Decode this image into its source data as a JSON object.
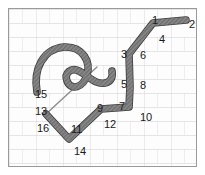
{
  "figure": {
    "background": "#fdfdfd",
    "border_color": "#9a9a9a",
    "stroke_color": "#7d7d7d",
    "stroke_outline_color": "#3c3c3c",
    "thin_line_color": "#8c8c8c",
    "label_color": "#1a1a1a"
  },
  "labels": [
    {
      "text": "1",
      "x": 143,
      "y": 6
    },
    {
      "text": "2",
      "x": 180,
      "y": 10
    },
    {
      "text": "3",
      "x": 112,
      "y": 40
    },
    {
      "text": "4",
      "x": 150,
      "y": 25
    },
    {
      "text": "5",
      "x": 112,
      "y": 70
    },
    {
      "text": "6",
      "x": 131,
      "y": 41
    },
    {
      "text": "7",
      "x": 110,
      "y": 92
    },
    {
      "text": "8",
      "x": 131,
      "y": 71
    },
    {
      "text": "9",
      "x": 88,
      "y": 94
    },
    {
      "text": "10",
      "x": 131,
      "y": 103
    },
    {
      "text": "11",
      "x": 62,
      "y": 115
    },
    {
      "text": "12",
      "x": 95,
      "y": 110
    },
    {
      "text": "13",
      "x": 26,
      "y": 97
    },
    {
      "text": "14",
      "x": 65,
      "y": 137
    },
    {
      "text": "15",
      "x": 26,
      "y": 80
    },
    {
      "text": "16",
      "x": 28,
      "y": 114
    }
  ],
  "paths": {
    "main_stroke": "M 177 11 L 144 14 L 120 45 L 121 78 L 120 98 L 92 100 L 60 130 L 37 105",
    "hook_curve": "M 28 83 C 24 60, 34 40, 55 38 C 74 37, 82 53, 78 66 C 74 79, 62 82, 58 72 C 55 64, 62 58, 70 62 C 80 67, 86 76, 96 74 C 102 73, 104 68, 103 62",
    "thin_tail": "M 37 105 L 88 58"
  },
  "path_geometry": {
    "stroke_width": 6,
    "thin_width": 1.4,
    "vertex_count": 16
  }
}
